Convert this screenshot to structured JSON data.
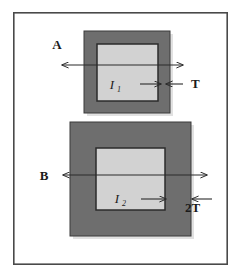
{
  "figure": {
    "background_color": "#ffffff",
    "frame": {
      "name": "outer-frame",
      "x": 13,
      "y": 12,
      "width": 215,
      "height": 253,
      "stroke_color": "#4a4a4a",
      "fill_color": "#ffffff",
      "stroke_width": 1.6
    },
    "colors": {
      "wall_fill": "#6e6e6e",
      "core_fill": "#d2d2d2",
      "outline": "#2b2b2b",
      "arrow": "#2b2b2b",
      "shadow": "#c8c8c8"
    },
    "shapes": [
      {
        "name": "upper-section-wall",
        "role": "wall",
        "x": 84,
        "y": 31,
        "width": 86,
        "height": 82,
        "fill": "#6e6e6e"
      },
      {
        "name": "upper-section-core",
        "role": "core",
        "x": 97,
        "y": 44,
        "width": 61,
        "height": 57,
        "fill": "#d2d2d2"
      },
      {
        "name": "lower-section-wall",
        "role": "wall",
        "x": 70,
        "y": 122,
        "width": 121,
        "height": 114,
        "fill": "#6e6e6e"
      },
      {
        "name": "lower-section-core",
        "role": "core",
        "x": 96,
        "y": 148,
        "width": 69,
        "height": 62,
        "fill": "#d2d2d2"
      }
    ],
    "labels": [
      {
        "name": "label-a",
        "text": "A",
        "x": 57,
        "y": 49,
        "style": "cap"
      },
      {
        "name": "label-t",
        "text": "T",
        "x": 191,
        "y": 83,
        "style": "cap"
      },
      {
        "name": "label-b",
        "text": "B",
        "x": 44,
        "y": 180,
        "style": "cap"
      },
      {
        "name": "label-2t",
        "text": "2T",
        "x": 185,
        "y": 212,
        "style": "cap"
      },
      {
        "name": "label-i1",
        "text": "I",
        "x": 112,
        "y": 87,
        "style": "italic"
      },
      {
        "name": "label-i1-sub",
        "text": "1",
        "x": 119,
        "y": 90,
        "style": "sub"
      },
      {
        "name": "label-i2",
        "text": "I",
        "x": 117,
        "y": 201,
        "style": "italic"
      },
      {
        "name": "label-i2-sub",
        "text": "2",
        "x": 124,
        "y": 204,
        "style": "sub"
      }
    ],
    "arrows": [
      {
        "name": "dimension-arrow-a",
        "kind": "double",
        "x1": 62,
        "y1": 65,
        "x2": 183,
        "y2": 65,
        "measures": "A"
      },
      {
        "name": "dimension-arrow-b",
        "kind": "double",
        "x1": 63,
        "y1": 175,
        "x2": 207,
        "y2": 175,
        "measures": "B"
      },
      {
        "name": "thickness-arrow-t-inner",
        "kind": "single",
        "x1": 140,
        "y1": 84,
        "x2": 161,
        "y2": 84,
        "measures": "T"
      },
      {
        "name": "thickness-arrow-t-outer",
        "kind": "single",
        "x1": 183,
        "y1": 84,
        "x2": 166,
        "y2": 84,
        "measures": "T"
      },
      {
        "name": "thickness-arrow-2t-inner",
        "kind": "single",
        "x1": 141,
        "y1": 199,
        "x2": 166,
        "y2": 199,
        "measures": "2T"
      },
      {
        "name": "thickness-arrow-2t-outer",
        "kind": "single",
        "x1": 212,
        "y1": 199,
        "x2": 192,
        "y2": 199,
        "measures": "2T"
      }
    ]
  }
}
